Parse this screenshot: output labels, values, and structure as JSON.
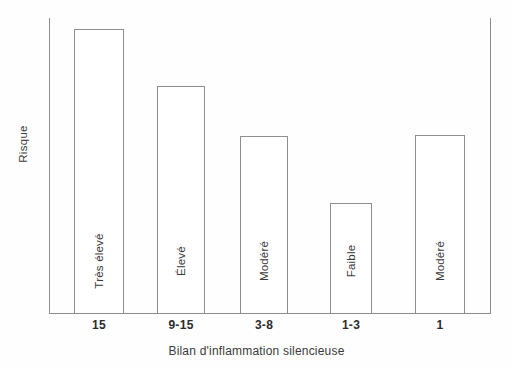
{
  "chart_data": {
    "type": "bar",
    "title": "",
    "xlabel": "Bilan d'inflammation silencieuse",
    "ylabel": "Risque",
    "categories": [
      "15",
      "9-15",
      "3-8",
      "1-3",
      "1"
    ],
    "bar_labels": [
      "Très élevé",
      "Élevé",
      "Modéré",
      "Faible",
      "Modéré"
    ],
    "values": [
      284,
      227,
      177,
      110,
      178
    ],
    "ylim": [
      0,
      296
    ],
    "grid": false,
    "legend": null,
    "bars": [
      {
        "category": "15",
        "label": "Très élevé",
        "value": 284,
        "left": 74,
        "width": 50,
        "top": 29,
        "height": 284
      },
      {
        "category": "9-15",
        "label": "Élevé",
        "value": 227,
        "left": 157,
        "width": 48,
        "top": 86,
        "height": 227
      },
      {
        "category": "3-8",
        "label": "Modéré",
        "value": 177,
        "left": 240,
        "width": 48,
        "top": 136,
        "height": 177
      },
      {
        "category": "1-3",
        "label": "Faible",
        "value": 110,
        "left": 330,
        "width": 42,
        "top": 203,
        "height": 110
      },
      {
        "category": "1",
        "label": "Modéré",
        "value": 178,
        "left": 415,
        "width": 50,
        "top": 135,
        "height": 178
      }
    ],
    "colors": {
      "bar_fill": "#ffffff",
      "bar_stroke": "#8e8e8e",
      "axis": "#8c8c8c",
      "text": "#3a3a3a",
      "tick_text": "#2b2b2b",
      "background": "#fefefe"
    }
  }
}
